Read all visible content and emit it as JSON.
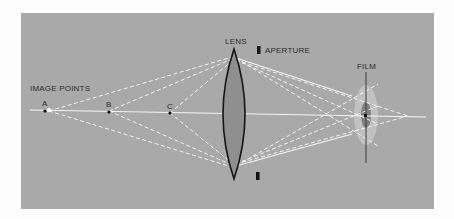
{
  "labels": {
    "image_points": "IMAGE POINTS",
    "point_a": "A",
    "point_b": "B",
    "point_c": "C",
    "lens": "LENS",
    "aperture": "APERTURE",
    "film": "FILM"
  },
  "colors": {
    "background": "#a9a9a9",
    "rays": "#f4f4f4",
    "lens_fill": "#8e8e8e",
    "lens_outline": "#1a1a1a",
    "blur_outer": "#c4c4c4",
    "blur_inner": "#7d7d7d"
  }
}
